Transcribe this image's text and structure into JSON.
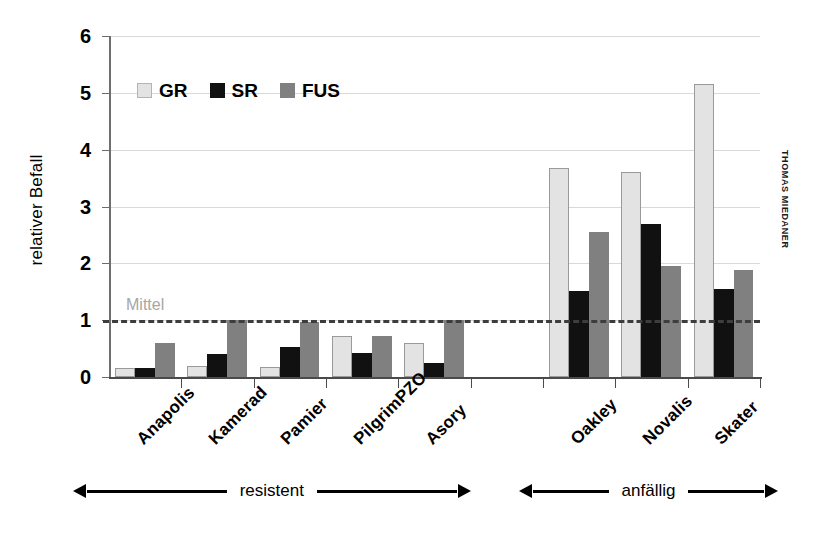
{
  "chart_data": {
    "type": "bar",
    "title": "",
    "xlabel": "",
    "ylabel": "relativer Befall",
    "ylim": [
      0,
      6
    ],
    "yticks": [
      0,
      1,
      2,
      3,
      4,
      5,
      6
    ],
    "grid": true,
    "legend_position": "top-left",
    "categories": [
      "Anapolis",
      "Kamerad",
      "Pamier",
      "PilgrimPZO",
      "Asory",
      "Oakley",
      "Novalis",
      "Skater"
    ],
    "series": [
      {
        "name": "GR",
        "color": "#e3e3e3",
        "values": [
          0.15,
          0.19,
          0.18,
          0.73,
          0.6,
          3.68,
          3.6,
          5.15
        ]
      },
      {
        "name": "SR",
        "color": "#111111",
        "values": [
          0.16,
          0.4,
          0.52,
          0.43,
          0.25,
          1.52,
          2.7,
          1.55
        ]
      },
      {
        "name": "FUS",
        "color": "#808080",
        "values": [
          0.6,
          1.0,
          0.96,
          0.73,
          1.0,
          2.55,
          1.96,
          1.89
        ]
      }
    ],
    "reference_line": {
      "label": "Mittel",
      "value": 1,
      "style": "dashed",
      "color": "#3d3d3d"
    },
    "annotations": [
      {
        "label": "resistent",
        "categories": [
          "Anapolis",
          "Kamerad",
          "Pamier",
          "PilgrimPZO",
          "Asory"
        ]
      },
      {
        "label": "anfällig",
        "categories": [
          "Oakley",
          "Novalis",
          "Skater"
        ]
      }
    ],
    "credit": "THOMAS MIEDANER"
  }
}
